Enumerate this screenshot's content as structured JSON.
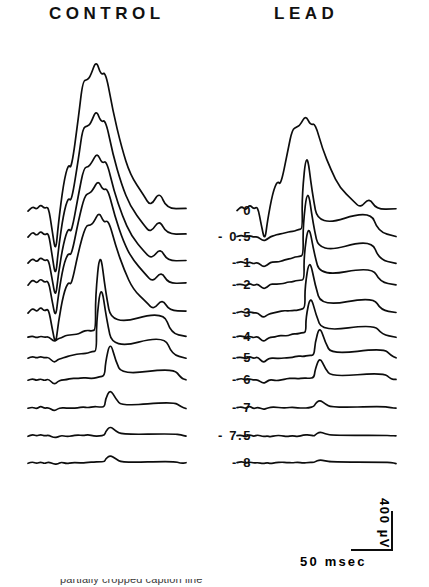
{
  "figure": {
    "background_color": "#ffffff",
    "trace_color": "#0d0d0d",
    "columns": [
      {
        "key": "control",
        "label": "CONTROL"
      },
      {
        "key": "lead",
        "label": "LEAD"
      }
    ]
  },
  "headers": {
    "control": "CONTROL",
    "lead": "LEAD"
  },
  "depth_labels": [
    {
      "text": "0",
      "value": 0
    },
    {
      "text": "- 0.5",
      "value": -0.5
    },
    {
      "text": "- 1",
      "value": -1
    },
    {
      "text": "- 2",
      "value": -2
    },
    {
      "text": "- 3",
      "value": -3
    },
    {
      "text": "- 4",
      "value": -4
    },
    {
      "text": "- 5",
      "value": -5
    },
    {
      "text": "- 6",
      "value": -6
    },
    {
      "text": "- 7",
      "value": -7
    },
    {
      "text": "- 7.5",
      "value": -7.5
    },
    {
      "text": "- 8",
      "value": -8
    }
  ],
  "scale_bar": {
    "x_label": "50 msec",
    "y_label": "400 µV",
    "x_value": 50,
    "x_unit": "msec",
    "y_value": 400,
    "y_unit": "µV"
  },
  "caption": {
    "text": "partially cropped caption line"
  },
  "chart_data": {
    "type": "line",
    "title": "",
    "xlabel": "",
    "ylabel": "",
    "legend_position": "top",
    "grid": false,
    "axis_note": "No drawn axes; traces are stacked vertically offset, depth in mm shown between columns",
    "x": {
      "unit": "msec",
      "scale_bar_length": 50,
      "range_approx": [
        0,
        200
      ]
    },
    "y": {
      "unit": "µV",
      "scale_bar_length": 400,
      "polarity": "upward positive"
    },
    "series_groups": [
      {
        "name": "CONTROL",
        "series": [
          {
            "depth": 0,
            "label": "0",
            "peak_amplitude_uv": 1400,
            "baseline_y_px": 211,
            "peak_y_px": 60,
            "peak_time_msec": 38,
            "notes": "largest response, notched apex"
          },
          {
            "depth": -0.5,
            "label": "- 0.5",
            "peak_amplitude_uv": 1150,
            "baseline_y_px": 237,
            "peak_y_px": 110,
            "peak_time_msec": 38,
            "notes": "notched apex"
          },
          {
            "depth": -1,
            "label": "- 1",
            "peak_amplitude_uv": 900,
            "baseline_y_px": 263,
            "peak_y_px": 152,
            "peak_time_msec": 39
          },
          {
            "depth": -2,
            "label": "- 2",
            "peak_amplitude_uv": 780,
            "baseline_y_px": 285,
            "peak_y_px": 180,
            "peak_time_msec": 40
          },
          {
            "depth": -3,
            "label": "- 3",
            "peak_amplitude_uv": 640,
            "baseline_y_px": 313,
            "peak_y_px": 212,
            "peak_time_msec": 41
          },
          {
            "depth": -4,
            "label": "- 4",
            "peak_amplitude_uv": 520,
            "baseline_y_px": 337,
            "peak_y_px": 248,
            "peak_time_msec": 42
          },
          {
            "depth": -5,
            "label": "- 5",
            "peak_amplitude_uv": 400,
            "baseline_y_px": 358,
            "peak_y_px": 282,
            "peak_time_msec": 43
          },
          {
            "depth": -6,
            "label": "- 6",
            "peak_amplitude_uv": 230,
            "baseline_y_px": 380,
            "peak_y_px": 341,
            "peak_time_msec": 55
          },
          {
            "depth": -7,
            "label": "- 7",
            "peak_amplitude_uv": 120,
            "baseline_y_px": 408,
            "peak_y_px": 389,
            "peak_time_msec": 72
          },
          {
            "depth": -7.5,
            "label": "- 7.5",
            "peak_amplitude_uv": 60,
            "baseline_y_px": 436,
            "peak_y_px": 426,
            "peak_time_msec": 80
          },
          {
            "depth": -8,
            "label": "- 8",
            "peak_amplitude_uv": 40,
            "baseline_y_px": 463,
            "peak_y_px": 455,
            "peak_time_msec": 84,
            "notes": "essentially flat noise"
          }
        ]
      },
      {
        "name": "LEAD",
        "series": [
          {
            "depth": 0,
            "label": "0",
            "peak_amplitude_uv": 1000,
            "baseline_y_px": 211,
            "peak_y_px": 115,
            "peak_time_msec": 38,
            "notes": "reduced vs control, notched"
          },
          {
            "depth": -0.5,
            "label": "- 0.5",
            "peak_amplitude_uv": 870,
            "baseline_y_px": 237,
            "peak_y_px": 148,
            "peak_time_msec": 39
          },
          {
            "depth": -1,
            "label": "- 1",
            "peak_amplitude_uv": 740,
            "baseline_y_px": 263,
            "peak_y_px": 185,
            "peak_time_msec": 40
          },
          {
            "depth": -2,
            "label": "- 2",
            "peak_amplitude_uv": 610,
            "baseline_y_px": 285,
            "peak_y_px": 222,
            "peak_time_msec": 41
          },
          {
            "depth": -3,
            "label": "- 3",
            "peak_amplitude_uv": 470,
            "baseline_y_px": 313,
            "peak_y_px": 258,
            "peak_time_msec": 42
          },
          {
            "depth": -4,
            "label": "- 4",
            "peak_amplitude_uv": 330,
            "baseline_y_px": 337,
            "peak_y_px": 295,
            "peak_time_msec": 43
          },
          {
            "depth": -5,
            "label": "- 5",
            "peak_amplitude_uv": 240,
            "baseline_y_px": 358,
            "peak_y_px": 326,
            "peak_time_msec": 54
          },
          {
            "depth": -6,
            "label": "- 6",
            "peak_amplitude_uv": 180,
            "baseline_y_px": 380,
            "peak_y_px": 357,
            "peak_time_msec": 62
          },
          {
            "depth": -7,
            "label": "- 7",
            "peak_amplitude_uv": 55,
            "baseline_y_px": 408,
            "peak_y_px": 400,
            "peak_time_msec": 74
          },
          {
            "depth": -7.5,
            "label": "- 7.5",
            "peak_amplitude_uv": 25,
            "baseline_y_px": 436,
            "peak_y_px": 432,
            "peak_time_msec": 80,
            "notes": "flat"
          },
          {
            "depth": -8,
            "label": "- 8",
            "peak_amplitude_uv": 15,
            "baseline_y_px": 463,
            "peak_y_px": 460,
            "peak_time_msec": 84,
            "notes": "flat noise"
          }
        ]
      }
    ]
  }
}
